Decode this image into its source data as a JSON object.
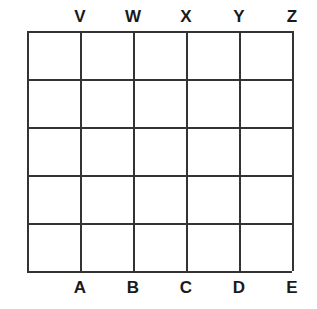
{
  "figure": {
    "background_color": "#ffffff",
    "line_color": "#333333",
    "label_color": "#1a1a1a"
  },
  "grid": {
    "rows": 5,
    "columns": 5,
    "cell_count": 25,
    "left": 27,
    "top": 31,
    "right": 292,
    "bottom": 271,
    "width": 265,
    "height": 240,
    "column_width": 53,
    "row_height": 48,
    "vertical_line_positions": [
      27,
      80,
      133,
      186,
      239,
      292
    ],
    "horizontal_line_positions": [
      31,
      79,
      127,
      175,
      223,
      271
    ],
    "cell_fill": "none"
  },
  "top_labels": [
    {
      "text": "V",
      "x": 80
    },
    {
      "text": "W",
      "x": 133
    },
    {
      "text": "X",
      "x": 186
    },
    {
      "text": "Y",
      "x": 239
    },
    {
      "text": "Z",
      "x": 292
    }
  ],
  "bottom_labels": [
    {
      "text": "A",
      "x": 80
    },
    {
      "text": "B",
      "x": 133
    },
    {
      "text": "C",
      "x": 186
    },
    {
      "text": "D",
      "x": 239
    },
    {
      "text": "E",
      "x": 292
    }
  ],
  "chart_data": {
    "type": "table",
    "title": "",
    "xlabel": "",
    "ylabel": "",
    "grid": true,
    "rows": 5,
    "columns": 5,
    "top_tick_labels": [
      "V",
      "W",
      "X",
      "Y",
      "Z"
    ],
    "bottom_tick_labels": [
      "A",
      "B",
      "C",
      "D",
      "E"
    ],
    "cells": [
      [
        "",
        "",
        "",
        "",
        ""
      ],
      [
        "",
        "",
        "",
        "",
        ""
      ],
      [
        "",
        "",
        "",
        "",
        ""
      ],
      [
        "",
        "",
        "",
        "",
        ""
      ],
      [
        "",
        "",
        "",
        "",
        ""
      ]
    ]
  }
}
